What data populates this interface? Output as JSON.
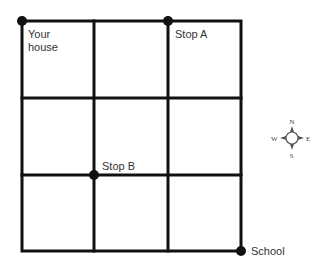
{
  "diagram": {
    "type": "street-grid-map",
    "grid": {
      "columns": 3,
      "rows": 3,
      "line_color": "#111111"
    },
    "points": [
      {
        "id": "your-house",
        "label_line1": "Your",
        "label_line2": "house",
        "node": [
          0,
          0
        ]
      },
      {
        "id": "stop-a",
        "label": "Stop A",
        "node": [
          2,
          0
        ]
      },
      {
        "id": "stop-b",
        "label": "Stop B",
        "node": [
          1,
          2
        ]
      },
      {
        "id": "school",
        "label": "School",
        "node": [
          3,
          3
        ]
      }
    ],
    "compass": {
      "n": "N",
      "s": "S",
      "e": "E",
      "w": "W"
    }
  }
}
